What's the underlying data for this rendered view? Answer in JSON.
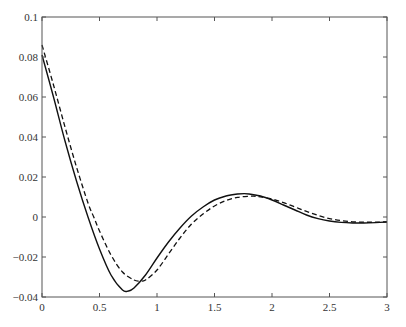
{
  "chart_data": {
    "type": "line",
    "title": "",
    "xlabel": "",
    "ylabel": "",
    "xlim": [
      0,
      3
    ],
    "ylim": [
      -0.04,
      0.1
    ],
    "grid": false,
    "legend": null,
    "x_ticks": [
      0,
      0.5,
      1,
      1.5,
      2,
      2.5,
      3
    ],
    "x_tick_labels": [
      "0",
      "0.5",
      "1",
      "1.5",
      "2",
      "2.5",
      "3"
    ],
    "y_ticks": [
      -0.04,
      -0.02,
      0,
      0.02,
      0.04,
      0.06,
      0.08,
      0.1
    ],
    "y_tick_labels": [
      "−0.04",
      "−0.02",
      "0",
      "0.02",
      "0.04",
      "0.06",
      "0.08",
      "0.1"
    ],
    "series": [
      {
        "name": "solid",
        "style": "solid",
        "color": "#111111",
        "x": [
          0,
          0.1,
          0.2,
          0.3,
          0.4,
          0.5,
          0.6,
          0.7,
          0.75,
          0.8,
          0.9,
          1.0,
          1.1,
          1.2,
          1.3,
          1.4,
          1.5,
          1.6,
          1.7,
          1.76,
          1.8,
          1.9,
          2.0,
          2.1,
          2.2,
          2.3,
          2.4,
          2.5,
          2.6,
          2.7,
          2.8,
          2.9,
          3.0
        ],
        "y": [
          0.081,
          0.06,
          0.038,
          0.018,
          0.0,
          -0.016,
          -0.029,
          -0.0365,
          -0.037,
          -0.0355,
          -0.029,
          -0.0205,
          -0.0125,
          -0.0055,
          0.0005,
          0.005,
          0.0085,
          0.0105,
          0.0115,
          0.0117,
          0.0115,
          0.0105,
          0.0085,
          0.006,
          0.0035,
          0.001,
          -0.0008,
          -0.002,
          -0.0027,
          -0.003,
          -0.003,
          -0.0028,
          -0.0025
        ]
      },
      {
        "name": "dashed",
        "style": "dashed",
        "color": "#111111",
        "x": [
          0,
          0.1,
          0.2,
          0.3,
          0.4,
          0.45,
          0.5,
          0.6,
          0.7,
          0.8,
          0.85,
          0.9,
          1.0,
          1.1,
          1.2,
          1.3,
          1.4,
          1.5,
          1.6,
          1.7,
          1.8,
          1.84,
          1.9,
          2.0,
          2.1,
          2.2,
          2.3,
          2.4,
          2.5,
          2.6,
          2.7,
          2.8,
          2.9,
          3.0
        ],
        "y": [
          0.086,
          0.066,
          0.045,
          0.025,
          0.007,
          0.0,
          -0.007,
          -0.019,
          -0.0275,
          -0.0315,
          -0.032,
          -0.0315,
          -0.0265,
          -0.0185,
          -0.0105,
          -0.0035,
          0.0015,
          0.0055,
          0.0082,
          0.0098,
          0.0104,
          0.0104,
          0.0101,
          0.009,
          0.0072,
          0.005,
          0.0028,
          0.0008,
          -0.0008,
          -0.0018,
          -0.0024,
          -0.0026,
          -0.0026,
          -0.0024
        ]
      }
    ]
  },
  "plot_area": {
    "left": 42,
    "top": 17,
    "right": 387,
    "bottom": 297
  }
}
